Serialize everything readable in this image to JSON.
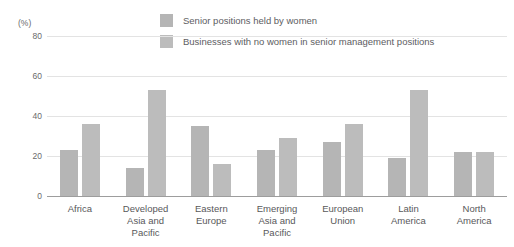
{
  "chart_data": {
    "type": "bar",
    "title": "",
    "subtitle": "",
    "xlabel": "",
    "ylabel": "(%)",
    "ylim": [
      0,
      80
    ],
    "yticks": [
      0,
      20,
      40,
      60,
      80
    ],
    "ytick_labels": [
      "0",
      "20",
      "40",
      "60",
      "80"
    ],
    "grid": true,
    "legend_position": "top-center",
    "categories": [
      "Africa",
      "Developed Asia and Pacific",
      "Eastern Europe",
      "Emerging Asia and Pacific",
      "European Union",
      "Latin America",
      "North America"
    ],
    "category_lines": [
      [
        "Africa",
        ""
      ],
      [
        "Developed",
        "Asia and Pacific"
      ],
      [
        "Eastern",
        "Europe"
      ],
      [
        "Emerging",
        "Asia and Pacific"
      ],
      [
        "European",
        "Union"
      ],
      [
        "Latin",
        "America"
      ],
      [
        "North",
        "America"
      ]
    ],
    "series": [
      {
        "name": "Senior positions held by women",
        "color": "#b5b5b5",
        "values": [
          23,
          14,
          35,
          23,
          27,
          19,
          22
        ]
      },
      {
        "name": "Businesses with no women in senior management positions",
        "color": "#bcbcbc",
        "values": [
          36,
          53,
          16,
          29,
          36,
          53,
          22
        ]
      }
    ]
  },
  "axis": {
    "unit_label": "(%)"
  },
  "legend": {
    "items": [
      {
        "label": "Senior positions held by women"
      },
      {
        "label": "Businesses with no women in senior management positions"
      }
    ]
  },
  "colors": {
    "series_1": "#b5b5b5",
    "series_2": "#bcbcbc",
    "gridline": "#e3e3e3",
    "baseline": "#9d9d9d",
    "text": "#58585a",
    "background": "#ffffff"
  }
}
